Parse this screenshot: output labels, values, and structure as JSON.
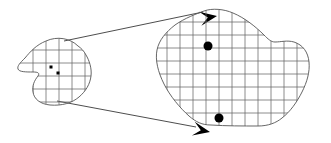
{
  "figure": {
    "background_color": "#ffffff",
    "outline_color": "#555555",
    "grid_color": "#666666",
    "marker_color": "#000000",
    "arrow_color": "#000000",
    "canvas": {
      "width": 331,
      "height": 143
    }
  },
  "source_region": {
    "name": "small-gridded-blob",
    "outline_path": "M 78 46 C 70 38 57 36 46 41 C 36 45 30 52 25 58 C 20 63 17 66 18 69 C 19 72 26 72 33 72 C 38 72 40 73 38 76 C 34 81 32 86 33 92 C 34 99 40 104 50 105 C 62 106 72 103 79 97 C 86 91 90 84 91 76 C 92 68 89 60 86 55 C 84 51 81 48 78 46 Z",
    "grid": {
      "spacing": 13,
      "vertical_lines_x": [
        33,
        46,
        59,
        72,
        85
      ],
      "horizontal_lines_y": [
        50,
        63,
        76,
        89,
        102
      ]
    },
    "markers": [
      {
        "name": "marker-square-1",
        "shape": "square",
        "cx": 51,
        "cy": 67,
        "size": 3
      },
      {
        "name": "marker-square-2",
        "shape": "square",
        "cx": 58,
        "cy": 73,
        "size": 3
      }
    ]
  },
  "target_region": {
    "name": "large-gridded-blob",
    "outline_path": "M 204 11 C 212 8 224 9 233 13 C 245 18 256 27 264 35 C 268 39 271 42 275 42 C 281 42 287 40 294 42 C 303 45 308 52 309 62 C 310 72 307 82 302 92 C 297 102 290 112 282 118 C 276 123 268 126 258 126 C 243 126 226 126 211 125 C 202 125 196 122 189 116 C 180 108 170 96 164 84 C 158 72 155 60 157 50 C 159 40 166 32 175 25 C 185 18 196 14 204 11 Z",
    "grid": {
      "spacing": 13,
      "vertical_lines_x": [
        167,
        180,
        193,
        206,
        219,
        232,
        245,
        258,
        271,
        284,
        297
      ],
      "horizontal_lines_y": [
        22,
        35,
        48,
        61,
        74,
        87,
        100,
        113
      ]
    },
    "markers": [
      {
        "name": "marker-dot-1",
        "shape": "circle",
        "cx": 208,
        "cy": 46,
        "r": 4.5
      },
      {
        "name": "marker-dot-2",
        "shape": "circle",
        "cx": 219,
        "cy": 118,
        "r": 4.5
      }
    ]
  },
  "connectors": [
    {
      "name": "connector-upper",
      "from": {
        "x": 64,
        "y": 41
      },
      "to": {
        "x": 203,
        "y": 12
      },
      "arrowhead": "at-end"
    },
    {
      "name": "connector-lower",
      "from": {
        "x": 57,
        "y": 101
      },
      "to": {
        "x": 196,
        "y": 127
      },
      "arrowhead": "at-end"
    }
  ]
}
